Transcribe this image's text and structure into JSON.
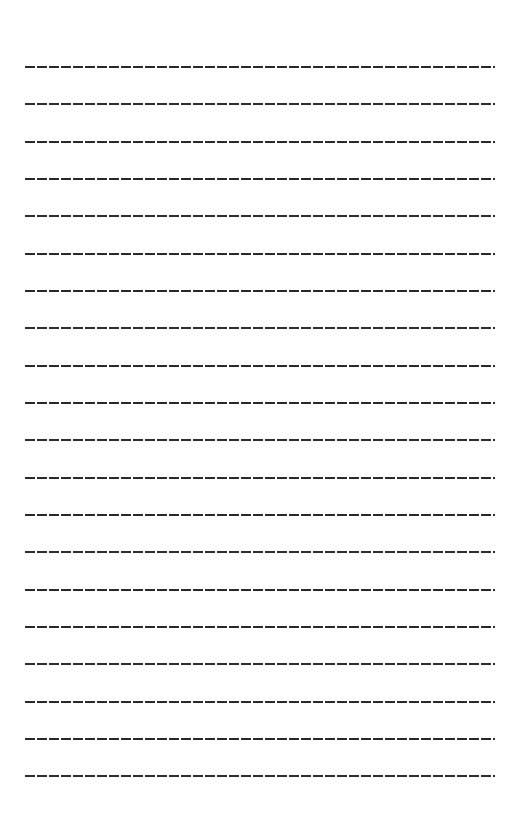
{
  "document": {
    "type": "lined-writing-sheet",
    "line_style": "dashed",
    "line_color": "#2a2a2a",
    "line_count": 20,
    "lines": [
      {
        "y": 67
      },
      {
        "y": 104
      },
      {
        "y": 142
      },
      {
        "y": 179
      },
      {
        "y": 216
      },
      {
        "y": 254
      },
      {
        "y": 291
      },
      {
        "y": 328
      },
      {
        "y": 366
      },
      {
        "y": 403
      },
      {
        "y": 440
      },
      {
        "y": 478
      },
      {
        "y": 515
      },
      {
        "y": 552
      },
      {
        "y": 590
      },
      {
        "y": 627
      },
      {
        "y": 664
      },
      {
        "y": 702
      },
      {
        "y": 739
      },
      {
        "y": 776
      }
    ]
  }
}
